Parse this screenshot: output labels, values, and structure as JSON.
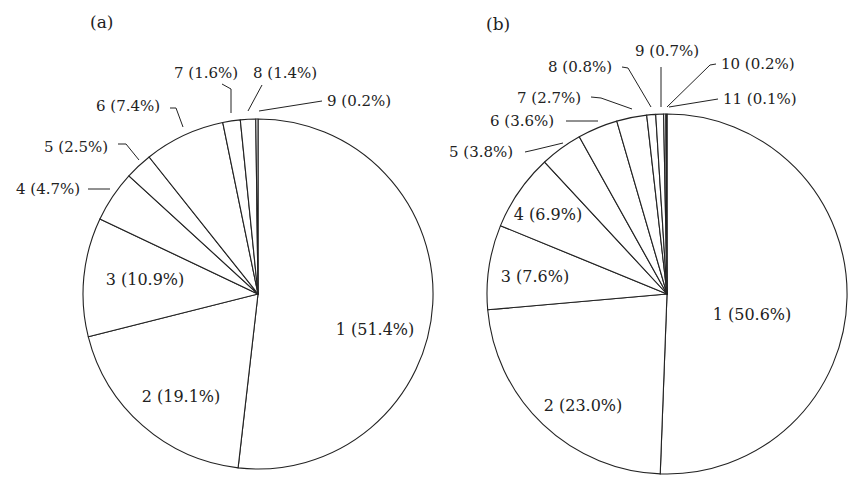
{
  "chart_data": [
    {
      "type": "pie",
      "panel_label": "(a)",
      "title": "",
      "start_angle": "12 o'clock",
      "direction": "clockwise",
      "slices": [
        {
          "label": "1 (51.4%)",
          "category": "1",
          "value": 51.4
        },
        {
          "label": "2 (19.1%)",
          "category": "2",
          "value": 19.1
        },
        {
          "label": "3 (10.9%)",
          "category": "3",
          "value": 10.9
        },
        {
          "label": "4 (4.7%)",
          "category": "4",
          "value": 4.7
        },
        {
          "label": "5 (2.5%)",
          "category": "5",
          "value": 2.5
        },
        {
          "label": "6 (7.4%)",
          "category": "6",
          "value": 7.4
        },
        {
          "label": "7 (1.6%)",
          "category": "7",
          "value": 1.6
        },
        {
          "label": "8 (1.4%)",
          "category": "8",
          "value": 1.4
        },
        {
          "label": "9 (0.2%)",
          "category": "9",
          "value": 0.2
        }
      ],
      "categories": [
        "1",
        "2",
        "3",
        "4",
        "5",
        "6",
        "7",
        "8",
        "9"
      ],
      "values": [
        51.4,
        19.1,
        10.9,
        4.7,
        2.5,
        7.4,
        1.6,
        1.4,
        0.2
      ],
      "fill": "#ffffff",
      "stroke": "#222222"
    },
    {
      "type": "pie",
      "panel_label": "(b)",
      "title": "",
      "start_angle": "12 o'clock",
      "direction": "clockwise",
      "slices": [
        {
          "label": "1 (50.6%)",
          "category": "1",
          "value": 50.6
        },
        {
          "label": "2 (23.0%)",
          "category": "2",
          "value": 23.0
        },
        {
          "label": "3 (7.6%)",
          "category": "3",
          "value": 7.6
        },
        {
          "label": "4 (6.9%)",
          "category": "4",
          "value": 6.9
        },
        {
          "label": "5 (3.8%)",
          "category": "5",
          "value": 3.8
        },
        {
          "label": "6 (3.6%)",
          "category": "6",
          "value": 3.6
        },
        {
          "label": "7 (2.7%)",
          "category": "7",
          "value": 2.7
        },
        {
          "label": "8 (0.8%)",
          "category": "8",
          "value": 0.8
        },
        {
          "label": "9 (0.7%)",
          "category": "9",
          "value": 0.7
        },
        {
          "label": "10 (0.2%)",
          "category": "10",
          "value": 0.2
        },
        {
          "label": "11 (0.1%)",
          "category": "11",
          "value": 0.1
        }
      ],
      "categories": [
        "1",
        "2",
        "3",
        "4",
        "5",
        "6",
        "7",
        "8",
        "9",
        "10",
        "11"
      ],
      "values": [
        50.6,
        23.0,
        7.6,
        6.9,
        3.8,
        3.6,
        2.7,
        0.8,
        0.7,
        0.2,
        0.1
      ],
      "fill": "#ffffff",
      "stroke": "#222222"
    }
  ]
}
